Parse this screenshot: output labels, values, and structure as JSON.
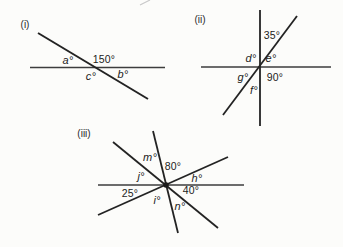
{
  "figure": {
    "description_colors": {
      "line_color": "#232323",
      "thin_line_color": "#3d3d3d",
      "text_color": "#1c1c1c",
      "background": "#fcfcfa"
    },
    "diagrams": {
      "i": {
        "caption": "(i)",
        "angles": {
          "a": "a°",
          "given150": "150°",
          "c": "c°",
          "b": "b°"
        }
      },
      "ii": {
        "caption": "(ii)",
        "angles": {
          "given35": "35°",
          "d": "d°",
          "e": "e°",
          "g": "g°",
          "given90": "90°",
          "f": "f°"
        }
      },
      "iii": {
        "caption": "(iii)",
        "angles": {
          "m": "m°",
          "given80": "80°",
          "j": "j°",
          "h": "h°",
          "given25": "25°",
          "i": "i°",
          "given40": "40°",
          "n": "n°"
        }
      }
    }
  }
}
